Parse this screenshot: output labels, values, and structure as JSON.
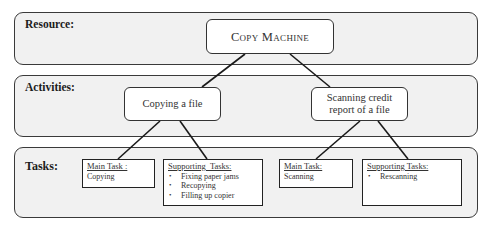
{
  "bands": {
    "resource": {
      "label": "Resource:"
    },
    "activities": {
      "label": "Activities:"
    },
    "tasks": {
      "label": "Tasks:"
    }
  },
  "resource": {
    "name": "Copy Machine"
  },
  "activities": [
    {
      "label": "Copying a file"
    },
    {
      "label_line1": "Scanning credit",
      "label_line2": "report of a file"
    }
  ],
  "tasks": [
    {
      "heading": "Main Task :",
      "items_text": "Copying"
    },
    {
      "heading": "Supporting  Tasks:",
      "bullets": [
        "Fixing paper jams",
        "Recopying",
        "Filling up copier"
      ]
    },
    {
      "heading": "Main Task:",
      "items_text": "Scanning"
    },
    {
      "heading": "Supporting Tasks:",
      "bullets": [
        "Rescanning"
      ]
    }
  ],
  "colors": {
    "band_fill": "#f1f1f1",
    "border": "#333333",
    "node_fill": "#ffffff"
  }
}
